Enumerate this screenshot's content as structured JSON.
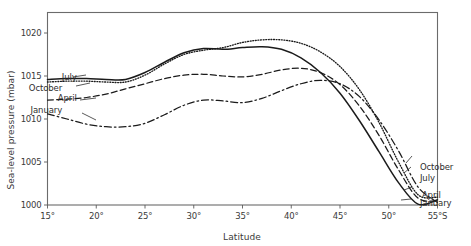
{
  "figure": {
    "title_visible": false,
    "caption_partial": "",
    "background": "#ffffff",
    "ink_color": "#1b1b1b"
  },
  "chart_data": {
    "type": "line",
    "title": "",
    "xlabel": "Latitude",
    "ylabel": "Sea-level pressure (mbar)",
    "xlim": [
      15,
      55
    ],
    "ylim": [
      1000,
      1022
    ],
    "xticks": [
      "15°",
      "20°",
      "25°",
      "30°",
      "35°",
      "40°",
      "45°",
      "50°",
      "55°S"
    ],
    "xtick_values": [
      15,
      20,
      25,
      30,
      35,
      40,
      45,
      50,
      55
    ],
    "yticks": [
      "1000",
      "1005",
      "1010",
      "1015",
      "1020"
    ],
    "ytick_values": [
      1000,
      1005,
      1010,
      1015,
      1020
    ],
    "grid": false,
    "legend_position": "inline-labels",
    "x_unit": "degrees south latitude",
    "y_unit": "mbar",
    "series": [
      {
        "name": "July",
        "style": "solid",
        "label_left": "July",
        "label_right": "July",
        "x": [
          15,
          17,
          19,
          21,
          23,
          25,
          27,
          29,
          31,
          33,
          35,
          37,
          39,
          41,
          43,
          45,
          47,
          49,
          51,
          53,
          55
        ],
        "values": [
          1014.6,
          1014.7,
          1014.7,
          1014.6,
          1014.6,
          1015.4,
          1016.6,
          1017.7,
          1018.2,
          1018.1,
          1018.3,
          1018.4,
          1018.1,
          1017.1,
          1015.4,
          1013.0,
          1009.8,
          1006.2,
          1002.6,
          1000.1,
          1000.6
        ]
      },
      {
        "name": "October",
        "style": "dotted",
        "label_left": "October",
        "label_right": "October",
        "x": [
          15,
          17,
          19,
          21,
          23,
          25,
          27,
          29,
          31,
          33,
          35,
          37,
          39,
          41,
          43,
          45,
          47,
          49,
          51,
          53,
          55
        ],
        "values": [
          1014.3,
          1014.4,
          1014.4,
          1014.3,
          1014.3,
          1015.1,
          1016.4,
          1017.5,
          1018.0,
          1018.3,
          1018.9,
          1019.2,
          1019.2,
          1018.8,
          1017.8,
          1016.1,
          1013.4,
          1009.6,
          1005.0,
          1001.2,
          1000.9
        ]
      },
      {
        "name": "April",
        "style": "dashed",
        "label_left": "April",
        "label_right": "April",
        "x": [
          15,
          17,
          19,
          21,
          23,
          25,
          27,
          29,
          31,
          33,
          35,
          37,
          39,
          41,
          43,
          45,
          47,
          49,
          51,
          53,
          55
        ],
        "values": [
          1012.2,
          1012.3,
          1012.5,
          1012.9,
          1013.5,
          1014.1,
          1014.7,
          1015.1,
          1015.2,
          1015.0,
          1014.9,
          1015.2,
          1015.7,
          1015.9,
          1015.4,
          1014.0,
          1011.5,
          1008.1,
          1004.1,
          1000.8,
          1000.5
        ]
      },
      {
        "name": "January",
        "style": "dash-dot",
        "label_left": "January",
        "label_right": "January",
        "x": [
          15,
          17,
          19,
          21,
          23,
          25,
          27,
          29,
          31,
          33,
          35,
          37,
          39,
          41,
          43,
          45,
          47,
          49,
          51,
          53,
          55
        ],
        "values": [
          1010.6,
          1010.0,
          1009.4,
          1009.1,
          1009.1,
          1009.5,
          1010.5,
          1011.6,
          1012.2,
          1012.1,
          1011.9,
          1012.4,
          1013.3,
          1014.1,
          1014.5,
          1014.1,
          1012.6,
          1009.9,
          1006.3,
          1002.1,
          1000.3
        ]
      }
    ],
    "annotations": [
      {
        "text": "July",
        "side": "left",
        "at_x": 18,
        "at_y": 1014.9
      },
      {
        "text": "October",
        "side": "left",
        "at_x": 16.5,
        "at_y": 1013.6
      },
      {
        "text": "April",
        "side": "left",
        "at_x": 18,
        "at_y": 1012.4
      },
      {
        "text": "January",
        "side": "left",
        "at_x": 16.5,
        "at_y": 1011.0
      },
      {
        "text": "October",
        "side": "right",
        "at_x": 53.2,
        "at_y": 1004.4
      },
      {
        "text": "July",
        "side": "right",
        "at_x": 53.2,
        "at_y": 1003.1
      },
      {
        "text": "April",
        "side": "right",
        "at_x": 53.4,
        "at_y": 1001.2
      },
      {
        "text": "January",
        "side": "right",
        "at_x": 53.2,
        "at_y": 1000.2
      }
    ]
  }
}
